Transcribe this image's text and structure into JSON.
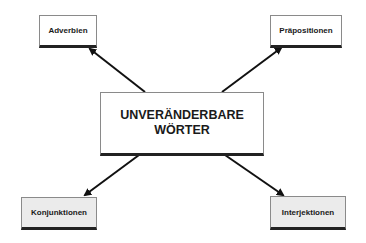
{
  "diagram": {
    "center": {
      "line1": "UNVERÄNDERBARE",
      "line2": "WÖRTER"
    },
    "nodes": [
      {
        "id": "adverbien",
        "label": "Adverbien",
        "position": "top-left"
      },
      {
        "id": "praepositionen",
        "label": "Präpositionen",
        "position": "top-right"
      },
      {
        "id": "konjunktionen",
        "label": "Konjunktionen",
        "position": "bottom-left"
      },
      {
        "id": "interjektionen",
        "label": "Interjektionen",
        "position": "bottom-right"
      }
    ],
    "edges": [
      {
        "from": "center",
        "to": "adverbien"
      },
      {
        "from": "center",
        "to": "praepositionen"
      },
      {
        "from": "center",
        "to": "konjunktionen"
      },
      {
        "from": "center",
        "to": "interjektionen"
      }
    ],
    "colors": {
      "arrow": "#111111",
      "box_border": "#8a8a8a",
      "box_shadow": "#222222",
      "gray_fill": "#ebebeb"
    }
  }
}
